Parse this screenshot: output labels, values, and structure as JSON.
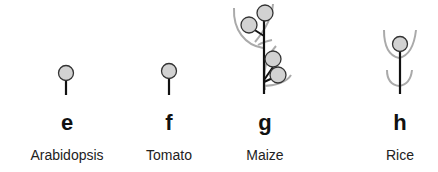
{
  "figure": {
    "panels": [
      {
        "letter": "e",
        "species": "Arabidopsis",
        "icon": "single-flower-inflorescence-icon"
      },
      {
        "letter": "f",
        "species": "Tomato",
        "icon": "single-flower-inflorescence-icon"
      },
      {
        "letter": "g",
        "species": "Maize",
        "icon": "branched-spikelet-inflorescence-icon"
      },
      {
        "letter": "h",
        "species": "Rice",
        "icon": "spikelet-with-glumes-icon"
      }
    ],
    "colors": {
      "flower_fill": "#d2d2d2",
      "flower_stroke": "#333333",
      "stem": "#111111",
      "bract": "#aaaaaa"
    }
  }
}
